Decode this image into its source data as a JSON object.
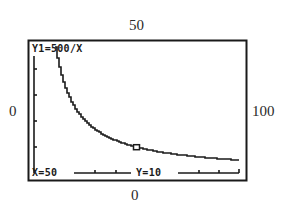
{
  "window_bounds": {
    "ymax_label": "50",
    "xmin_label": "0",
    "xmax_label": "100",
    "ymin_label": "0"
  },
  "screen": {
    "function_label": "Y1=500/X",
    "cursor_x_label": "X=50",
    "cursor_y_label": "Y=10",
    "frame_color": "#1a1a1a",
    "curve_color": "#1a1a1a",
    "background_color": "#ffffff"
  },
  "chart_data": {
    "type": "line",
    "title": "Y1=500/X",
    "function": "Y1=500/X",
    "xlabel": "",
    "ylabel": "",
    "xlim": [
      0,
      100
    ],
    "ylim": [
      0,
      50
    ],
    "grid": false,
    "legend": "none",
    "x_axis_ticks_every": 10,
    "y_axis_ticks_every": 10,
    "series": [
      {
        "name": "Y1=500/X",
        "x": [
          10,
          12.5,
          15,
          20,
          25,
          30,
          40,
          50,
          60,
          70,
          80,
          90,
          100
        ],
        "y": [
          50,
          40,
          33.3,
          25,
          20,
          16.7,
          12.5,
          10,
          8.3,
          7.1,
          6.25,
          5.6,
          5
        ]
      }
    ],
    "trace_cursor": {
      "x": 50,
      "y": 10
    },
    "annotations": [
      "X=50",
      "Y=10"
    ],
    "window": {
      "xmin": 0,
      "xmax": 100,
      "ymin": 0,
      "ymax": 50
    }
  }
}
